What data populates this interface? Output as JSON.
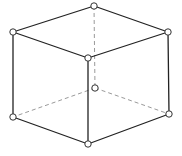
{
  "diagram": {
    "type": "wireframe-cube",
    "colors": {
      "background": "#ffffff",
      "solid_edge": "#222222",
      "hidden_edge": "#9a9a9a",
      "vertex_fill": "#ffffff",
      "vertex_stroke": "#333333"
    },
    "vertex_radius": 3.2,
    "vertices": {
      "top_back": {
        "x": 94,
        "y": 6
      },
      "top_left": {
        "x": 13,
        "y": 32
      },
      "top_right": {
        "x": 168,
        "y": 32
      },
      "top_front": {
        "x": 88,
        "y": 58
      },
      "bottom_back": {
        "x": 95,
        "y": 88
      },
      "bottom_left": {
        "x": 13,
        "y": 117
      },
      "bottom_right": {
        "x": 169,
        "y": 114
      },
      "bottom_front": {
        "x": 88,
        "y": 144
      }
    },
    "solid_edges": [
      [
        "top_back",
        "top_left"
      ],
      [
        "top_back",
        "top_right"
      ],
      [
        "top_left",
        "top_front"
      ],
      [
        "top_right",
        "top_front"
      ],
      [
        "top_left",
        "bottom_left"
      ],
      [
        "top_right",
        "bottom_right"
      ],
      [
        "top_front",
        "bottom_front"
      ],
      [
        "bottom_left",
        "bottom_front"
      ],
      [
        "bottom_right",
        "bottom_front"
      ]
    ],
    "hidden_edges": [
      [
        "top_back",
        "bottom_back"
      ],
      [
        "bottom_back",
        "bottom_left"
      ],
      [
        "bottom_back",
        "bottom_right"
      ]
    ]
  }
}
